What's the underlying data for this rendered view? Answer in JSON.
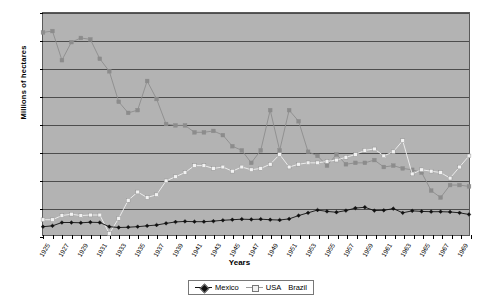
{
  "chart_data": {
    "type": "line",
    "title": "",
    "xlabel": "Years",
    "ylabel": "Millions of hectares",
    "ylim": [
      0,
      8
    ],
    "ytick_values": [
      0,
      1,
      2,
      3,
      4,
      5,
      6,
      7,
      8
    ],
    "ytick_labels": [
      "0",
      "1",
      "2",
      "3",
      "4",
      "5",
      "6",
      "7",
      "8"
    ],
    "grid": true,
    "grid_axis": "y",
    "legend_position": "bottom-center",
    "plot_background": "#b3b3b3",
    "x": [
      1925,
      1926,
      1927,
      1928,
      1929,
      1930,
      1931,
      1932,
      1933,
      1934,
      1935,
      1936,
      1937,
      1938,
      1939,
      1940,
      1941,
      1942,
      1943,
      1944,
      1945,
      1946,
      1947,
      1948,
      1949,
      1950,
      1951,
      1952,
      1953,
      1954,
      1955,
      1956,
      1957,
      1958,
      1959,
      1960,
      1961,
      1962,
      1963,
      1964,
      1965,
      1966,
      1967,
      1968,
      1969,
      1970
    ],
    "xtick_labels": [
      "1925",
      "1927",
      "1929",
      "1931",
      "1933",
      "1935",
      "1937",
      "1939",
      "1941",
      "1943",
      "1945",
      "1947",
      "1949",
      "1951",
      "1953",
      "1955",
      "1957",
      "1959",
      "1961",
      "1963",
      "1965",
      "1967",
      "1969"
    ],
    "xtick_step_years": 2,
    "series": [
      {
        "name": "Mexico",
        "color": "#101010",
        "marker": "diamond",
        "values": [
          0.3,
          0.33,
          0.45,
          0.45,
          0.44,
          0.46,
          0.45,
          0.3,
          0.27,
          0.28,
          0.3,
          0.33,
          0.36,
          0.42,
          0.47,
          0.49,
          0.48,
          0.48,
          0.5,
          0.53,
          0.55,
          0.57,
          0.56,
          0.57,
          0.55,
          0.54,
          0.58,
          0.7,
          0.8,
          0.9,
          0.85,
          0.82,
          0.88,
          0.97,
          1.0,
          0.88,
          0.89,
          0.95,
          0.8,
          0.87,
          0.85,
          0.84,
          0.84,
          0.83,
          0.8,
          0.74
        ]
      },
      {
        "name": "USA",
        "color": "#f2f2f2",
        "marker": "square",
        "values": [
          0.55,
          0.55,
          0.7,
          0.75,
          0.7,
          0.72,
          0.72,
          0.05,
          0.6,
          1.25,
          1.55,
          1.35,
          1.45,
          1.95,
          2.1,
          2.25,
          2.5,
          2.5,
          2.4,
          2.45,
          2.3,
          2.45,
          2.35,
          2.4,
          2.55,
          2.9,
          2.45,
          2.55,
          2.6,
          2.6,
          2.65,
          2.7,
          2.8,
          2.9,
          3.05,
          3.1,
          2.85,
          3.0,
          3.4,
          2.2,
          2.35,
          2.3,
          2.25,
          2.05,
          2.45,
          2.85
        ]
      },
      {
        "name": "Brazil",
        "color": "#8c8c8c",
        "marker": "square",
        "values": [
          7.3,
          7.35,
          6.3,
          6.95,
          7.1,
          7.05,
          6.35,
          5.9,
          4.8,
          4.4,
          4.5,
          5.55,
          4.9,
          4.0,
          3.95,
          3.95,
          3.7,
          3.7,
          3.75,
          3.6,
          3.2,
          3.05,
          2.6,
          3.05,
          4.5,
          3.05,
          4.5,
          4.1,
          3.0,
          2.85,
          2.5,
          2.9,
          2.55,
          2.6,
          2.6,
          2.7,
          2.45,
          2.5,
          2.4,
          2.35,
          2.25,
          1.6,
          1.35,
          1.8,
          1.8,
          1.75
        ]
      }
    ]
  }
}
